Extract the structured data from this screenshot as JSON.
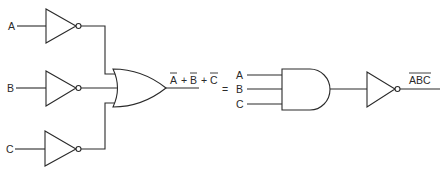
{
  "diagram": {
    "left_circuit": {
      "inputs": [
        "A",
        "B",
        "C"
      ],
      "gates": [
        "NOT",
        "NOT",
        "NOT",
        "OR"
      ],
      "output_expression": {
        "terms": [
          "A",
          "B",
          "C"
        ],
        "operator": "+",
        "overline_each": true,
        "text": "Ā + B̄ + C̄"
      }
    },
    "equals_sign": "=",
    "right_circuit": {
      "inputs": [
        "A",
        "B",
        "C"
      ],
      "gates": [
        "AND",
        "NOT"
      ],
      "output_expression": {
        "text": "ABC",
        "overline_whole": true
      }
    },
    "colors": {
      "line": "#2a2a2a",
      "background": "#ffffff"
    }
  }
}
